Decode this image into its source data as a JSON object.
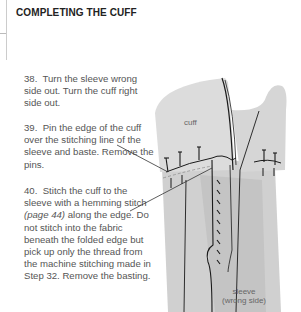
{
  "page": {
    "title": "COMPLETING THE CUFF"
  },
  "steps": [
    {
      "number": "38.",
      "text": "Turn the sleeve wrong side out. Turn the cuff right side out."
    },
    {
      "number": "39.",
      "text": "Pin the edge of the cuff over the stitching line of the sleeve and baste. Remove the pins."
    },
    {
      "number": "40.",
      "text_before": "Stitch the cuff to the sleeve with a hemming stitch ",
      "reference": "(page 44)",
      "text_after": " along the edge. Do not stitch into the fabric beneath the folded edge but pick up only the thread from the machine stitching made in Step 32. Remove the basting."
    }
  ],
  "illustration": {
    "labels": {
      "cuff": "cuff",
      "sleeve_line1": "sleeve",
      "sleeve_line2": "(wrong side)"
    },
    "colors": {
      "fabric": "#d9d9d9",
      "fabric_dark": "#c8c8c8",
      "line": "#1a1a1a"
    }
  }
}
